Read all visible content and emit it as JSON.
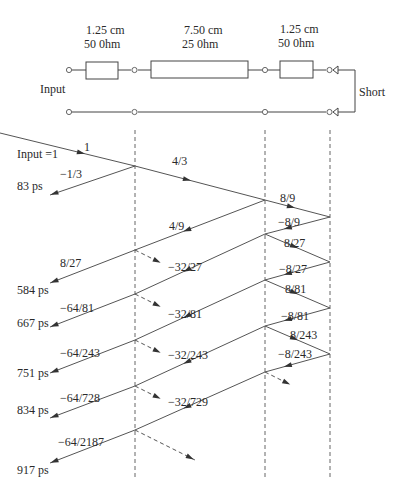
{
  "circuit": {
    "segments": [
      {
        "length": "1.25 cm",
        "impedance": "50 0hm"
      },
      {
        "length": "7.50 cm",
        "impedance": "25 0hm"
      },
      {
        "length": "1.25 cm",
        "impedance": "50 0hm"
      }
    ],
    "input_label": "Input",
    "termination_label": "Short"
  },
  "lattice": {
    "input_label": "Input =1",
    "incident": "1",
    "through_1": "4/3",
    "through_2": "8/9",
    "reflection_first": "−1/3",
    "returned_left": [
      {
        "coef": "8/27",
        "time": "584 ps"
      },
      {
        "coef": "−64/81",
        "time": "667 ps"
      },
      {
        "coef": "−64/243",
        "time": "751 ps"
      },
      {
        "coef": "−64/728",
        "time": "834 ps"
      },
      {
        "coef": "−64/2187",
        "time": "917 ps"
      }
    ],
    "first_time": "83 ps",
    "mid_backward": [
      "4/9"
    ],
    "mid_dashed": [
      "−32/27",
      "−32/81",
      "−32/243",
      "−32/729"
    ],
    "right_bounce": [
      {
        "down": "−8/9",
        "up": "8/27"
      },
      {
        "down": "−8/27",
        "up": "8/81"
      },
      {
        "down": "−8/81",
        "up": "8/243"
      },
      {
        "down": "−8/243",
        "up": ""
      }
    ]
  }
}
